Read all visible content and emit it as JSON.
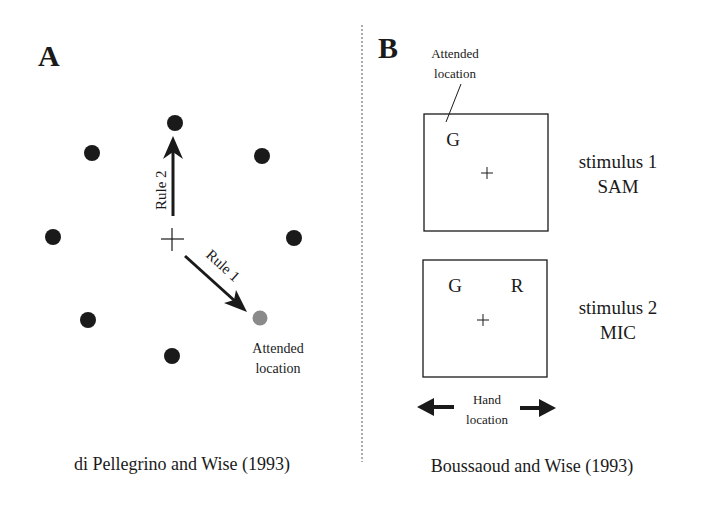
{
  "panel_a": {
    "label": "A",
    "rule2_label": "Rule 2",
    "rule1_label": "Rule 1",
    "attended_line1": "Attended",
    "attended_line2": "location",
    "caption": "di Pellegrino and Wise (1993)"
  },
  "panel_b": {
    "label": "B",
    "attended_line1": "Attended",
    "attended_line2": "location",
    "stimulus1": {
      "letter_g": "G",
      "line1": "stimulus 1",
      "line2": "SAM"
    },
    "stimulus2": {
      "letter_g": "G",
      "letter_r": "R",
      "line1": "stimulus 2",
      "line2": "MIC"
    },
    "hand_line1": "Hand",
    "hand_line2": "location",
    "caption": "Boussaoud and Wise (1993)"
  },
  "colors": {
    "ink": "#1a1a1a",
    "attended_dot": "#8a8a8a",
    "divider": "#777777"
  }
}
